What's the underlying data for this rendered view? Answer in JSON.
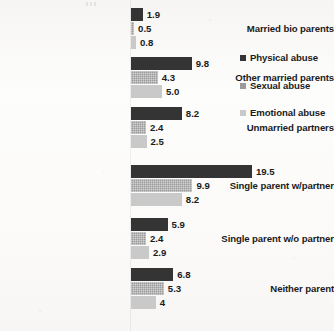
{
  "chart_data": {
    "type": "bar",
    "orientation": "horizontal",
    "title": "",
    "subtitle": "",
    "xlabel": "",
    "ylabel": "",
    "grid": false,
    "legend_position": "right",
    "xlim": [
      0,
      19.5
    ],
    "categories": [
      "Married bio parents",
      "Other married parents",
      "Unmarried partners",
      "Single parent w/partner",
      "Single parent w/o partner",
      "Neither parent"
    ],
    "series": [
      {
        "name": "Physical abuse",
        "color": "#343434",
        "values": [
          1.9,
          9.8,
          8.2,
          19.5,
          5.9,
          6.8
        ],
        "labels": [
          "1.9",
          "9.8",
          "8.2",
          "19.5",
          "5.9",
          "6.8"
        ]
      },
      {
        "name": "Sexual abuse",
        "color": "#9b9b9b",
        "values": [
          0.5,
          4.3,
          2.4,
          9.9,
          2.4,
          5.3
        ],
        "labels": [
          "0.5",
          "4.3",
          "2.4",
          "9.9",
          "2.4",
          "5.3"
        ]
      },
      {
        "name": "Emotional abuse",
        "color": "#c9c9c9",
        "values": [
          0.8,
          5.0,
          2.5,
          8.2,
          2.9,
          4.0
        ],
        "labels": [
          "0.8",
          "5.0",
          "2.5",
          "8.2",
          "2.9",
          "4"
        ]
      }
    ]
  },
  "legend": {
    "entries": [
      {
        "label": "Physical abuse",
        "swatch": "legend-swatch-physical-abuse"
      },
      {
        "label": "Sexual abuse",
        "swatch": "legend-swatch-sexual-abuse"
      },
      {
        "label": "Emotional abuse",
        "swatch": "legend-swatch-emotional-abuse"
      }
    ]
  }
}
